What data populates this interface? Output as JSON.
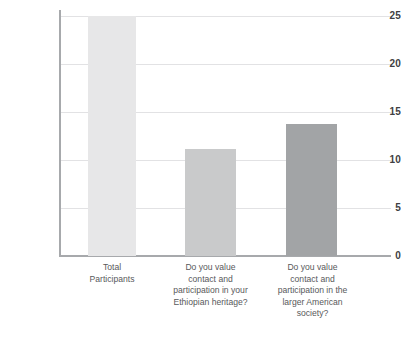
{
  "chart_data": {
    "type": "bar",
    "title": "",
    "subtitle": "",
    "xlabel": "",
    "ylabel": "",
    "ylim": [
      0,
      25
    ],
    "ytick_values": [
      0,
      5,
      10,
      15,
      20,
      25
    ],
    "ytick_labels": [
      "0",
      "5",
      "10",
      "15",
      "20",
      "25"
    ],
    "grid": true,
    "legend": false,
    "legend_position": "none",
    "categories": [
      "Total Participants",
      "Do you value contact and participation in your Ethiopian heritage?",
      "Do you value contact and participation in the larger American society?"
    ],
    "category_lines": [
      [
        "Total",
        "Participants"
      ],
      [
        "Do you value",
        "contact and",
        "participation in your",
        "Ethiopian heritage?"
      ],
      [
        "Do you value",
        "contact and",
        "participation in the",
        "larger American",
        "society?"
      ]
    ],
    "values": [
      25,
      11.1,
      13.8
    ],
    "bar_colors": [
      "#e7e7e8",
      "#c9cacb",
      "#a2a4a6"
    ]
  },
  "axis": {
    "line_color": "#a7a9ac",
    "grid_color": "#e2e2e4",
    "tick_label_color": "#414042"
  },
  "labels": {
    "text_color": "#58595b"
  }
}
